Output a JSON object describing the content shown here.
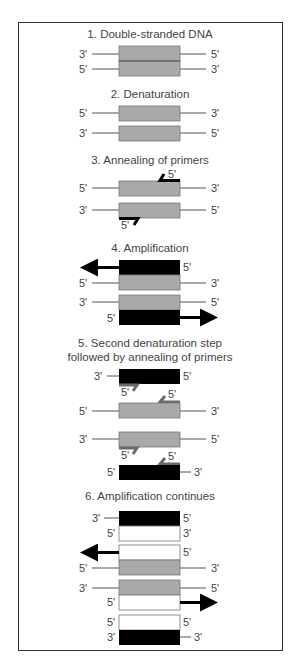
{
  "colors": {
    "gray_strand": "#a9a9a9",
    "black_strand": "#000000",
    "white_strand": "#ffffff",
    "primer_black": "#000000",
    "primer_gray": "#6b6b6b",
    "line": "#555555",
    "text": "#444444"
  },
  "steps": [
    {
      "title": "1. Double-stranded DNA"
    },
    {
      "title": "2. Denaturation"
    },
    {
      "title": "3. Annealing of primers"
    },
    {
      "title": "4. Amplification"
    },
    {
      "title_line1": "5. Second denaturation step",
      "title_line2": "followed by annealing of primers"
    },
    {
      "title": "6. Amplification continues"
    }
  ],
  "labels": {
    "three_prime": "3'",
    "five_prime": "5'"
  }
}
